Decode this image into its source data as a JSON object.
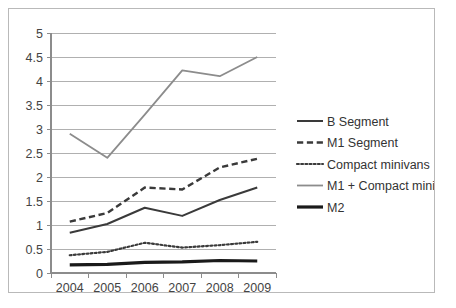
{
  "chart_data": {
    "type": "line",
    "title": "",
    "xlabel": "",
    "ylabel": "",
    "categories": [
      "2004",
      "2005",
      "2006",
      "2007",
      "2008",
      "2009"
    ],
    "x_tick_labels": [
      "2004",
      "2005",
      "2006",
      "2007",
      "2008",
      "2009"
    ],
    "y_tick_labels": [
      "0",
      "0.5",
      "1",
      "1.5",
      "2",
      "2.5",
      "3",
      "3.5",
      "4",
      "4.5",
      "5"
    ],
    "ylim": [
      0,
      5
    ],
    "y_step": 0.5,
    "grid": "horizontal",
    "legend_position": "right",
    "series": [
      {
        "name": "B Segment",
        "style": "solid",
        "color": "#3a3a3a",
        "width": 2,
        "values": [
          0.84,
          1.02,
          1.36,
          1.19,
          1.52,
          1.78
        ]
      },
      {
        "name": "M1 Segment",
        "style": "dashed",
        "color": "#3a3a3a",
        "width": 2.4,
        "values": [
          1.07,
          1.25,
          1.78,
          1.74,
          2.2,
          2.38
        ]
      },
      {
        "name": "Compact minivans",
        "style": "dotted",
        "color": "#3a3a3a",
        "width": 2.2,
        "values": [
          0.37,
          0.44,
          0.63,
          0.53,
          0.58,
          0.65
        ]
      },
      {
        "name": "M1 + Compact minivans",
        "style": "solid",
        "color": "#8c8c8c",
        "width": 1.8,
        "values": [
          2.9,
          2.4,
          3.3,
          4.22,
          4.1,
          4.5
        ]
      },
      {
        "name": "M2",
        "style": "solid",
        "color": "#1a1a1a",
        "width": 3.2,
        "values": [
          0.17,
          0.18,
          0.22,
          0.23,
          0.26,
          0.25
        ]
      }
    ]
  },
  "legend": {
    "items": [
      {
        "label": "B Segment"
      },
      {
        "label": "M1 Segment"
      },
      {
        "label": "Compact minivans"
      },
      {
        "label": "M1 + Compact minivans"
      },
      {
        "label": "M2"
      }
    ]
  },
  "caption": {
    "text": ""
  },
  "colors": {
    "frame_border": "#b9b9b9",
    "gridline": "#b0b0b0",
    "axis": "#8c8c8c",
    "tick_text": "#444444",
    "background": "#ffffff"
  }
}
